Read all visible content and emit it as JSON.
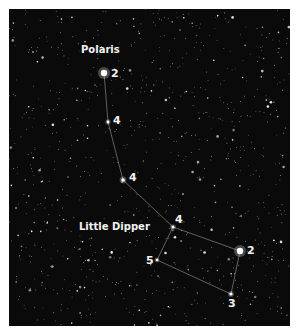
{
  "title_label": "Polaris",
  "constellation_label": "Little Dipper",
  "stars": [
    {
      "name": "polaris",
      "x": 104,
      "y": 73,
      "r": 3.2,
      "mag": "2"
    },
    {
      "name": "star-2",
      "x": 108,
      "y": 122,
      "r": 1.4,
      "mag": "4"
    },
    {
      "name": "star-3",
      "x": 123,
      "y": 180,
      "r": 1.8,
      "mag": "4"
    },
    {
      "name": "star-4",
      "x": 173,
      "y": 227,
      "r": 1.5,
      "mag": "4"
    },
    {
      "name": "kochab",
      "x": 240,
      "y": 251,
      "r": 3.2,
      "mag": "2"
    },
    {
      "name": "pherkad",
      "x": 231,
      "y": 294,
      "r": 1.6,
      "mag": "3"
    },
    {
      "name": "star-7",
      "x": 157,
      "y": 260,
      "r": 1.3,
      "mag": "5"
    }
  ],
  "labels": {
    "m1": "2",
    "m2": "4",
    "m3": "4",
    "m4": "4",
    "m5": "2",
    "m6": "3",
    "m7": "5"
  }
}
